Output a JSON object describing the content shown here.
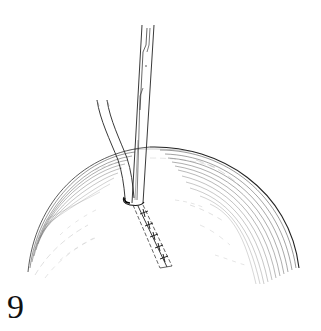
{
  "figure": {
    "label": "9",
    "elements": {
      "dome": "dome-shaped tissue surface with line hatching",
      "instrument": "narrow straight surgical instrument",
      "tube": "curved tube / catheter",
      "incision": "sutured incision with cross-stitches"
    },
    "stitch_count": 5
  },
  "colors": {
    "background": "#ffffff",
    "ink": "#1a1a1a",
    "hatch": "#555555"
  }
}
